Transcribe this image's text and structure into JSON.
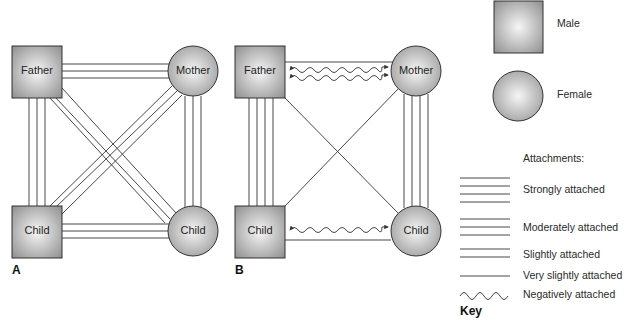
{
  "panels": [
    {
      "id": "A",
      "label": "A",
      "nodes": {
        "father": {
          "label": "Father",
          "shape": "square"
        },
        "mother": {
          "label": "Mother",
          "shape": "circle"
        },
        "child_male": {
          "label": "Child",
          "shape": "square"
        },
        "child_female": {
          "label": "Child",
          "shape": "circle"
        }
      },
      "edges": [
        {
          "from": "father",
          "to": "mother",
          "type": "moderately"
        },
        {
          "from": "father",
          "to": "child_male",
          "type": "moderately"
        },
        {
          "from": "father",
          "to": "child_female",
          "type": "moderately"
        },
        {
          "from": "mother",
          "to": "child_male",
          "type": "moderately"
        },
        {
          "from": "mother",
          "to": "child_female",
          "type": "moderately"
        },
        {
          "from": "child_male",
          "to": "child_female",
          "type": "moderately"
        }
      ]
    },
    {
      "id": "B",
      "label": "B",
      "nodes": {
        "father": {
          "label": "Father",
          "shape": "square"
        },
        "mother": {
          "label": "Mother",
          "shape": "circle"
        },
        "child_male": {
          "label": "Child",
          "shape": "square"
        },
        "child_female": {
          "label": "Child",
          "shape": "circle"
        }
      },
      "edges": [
        {
          "from": "father",
          "to": "mother",
          "type": "very_slightly"
        },
        {
          "from": "father",
          "to": "mother",
          "type": "negatively"
        },
        {
          "from": "father",
          "to": "mother",
          "type": "negatively"
        },
        {
          "from": "father",
          "to": "child_male",
          "type": "strongly"
        },
        {
          "from": "father",
          "to": "child_female",
          "type": "very_slightly"
        },
        {
          "from": "mother",
          "to": "child_male",
          "type": "very_slightly"
        },
        {
          "from": "mother",
          "to": "child_female",
          "type": "strongly"
        },
        {
          "from": "child_male",
          "to": "child_female",
          "type": "very_slightly"
        },
        {
          "from": "child_male",
          "to": "child_female",
          "type": "negatively"
        }
      ]
    }
  ],
  "legend": {
    "shapes": [
      {
        "shape": "square",
        "label": "Male"
      },
      {
        "shape": "circle",
        "label": "Female"
      }
    ],
    "attachments_title": "Attachments:",
    "attachments": [
      {
        "type": "strongly",
        "lines": 4,
        "label": "Strongly attached"
      },
      {
        "type": "moderately",
        "lines": 3,
        "label": "Moderately attached"
      },
      {
        "type": "slightly",
        "lines": 2,
        "label": "Slightly attached"
      },
      {
        "type": "very_slightly",
        "lines": 1,
        "label": "Very slightly attached"
      },
      {
        "type": "negatively",
        "lines": 0,
        "label": "Negatively attached"
      }
    ],
    "key_label": "Key"
  },
  "colors": {
    "line": "#333333",
    "shape_fill_light": "#f4f4f4",
    "shape_fill_dark": "#9a9a9a",
    "shape_stroke": "#333333"
  }
}
